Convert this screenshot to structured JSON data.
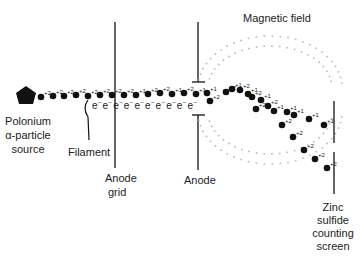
{
  "labels": {
    "source": [
      "Polonium",
      "α-particle",
      "source"
    ],
    "filament": "Filament",
    "anode_grid": [
      "Anode",
      "grid"
    ],
    "anode": "Anode",
    "magnetic_field": "Magnetic field",
    "screen": [
      "Zinc",
      "sulfide",
      "counting",
      "screen"
    ]
  },
  "beam_charges": [
    "+2",
    "+2",
    "+2",
    "+2",
    "+2",
    "+2",
    "+2",
    "+2",
    "+1",
    "+2",
    "+2",
    "+1",
    "+2",
    "+1",
    "+1",
    "+2"
  ],
  "electron_symbol": "e",
  "electron_sup": "−",
  "electron_count": 10,
  "upper_path_charges": [
    "+1",
    "+1",
    "+2",
    "+1",
    "+2",
    "+1",
    "+2",
    "+1",
    "+1",
    "+1",
    "+1"
  ],
  "lower_path_charges": [
    "+2",
    "+2",
    "+2",
    "+2",
    "+2",
    "+2",
    "+2",
    "+2"
  ],
  "colors": {
    "ink": "#111111",
    "field_dots": "#b8b8b8"
  }
}
